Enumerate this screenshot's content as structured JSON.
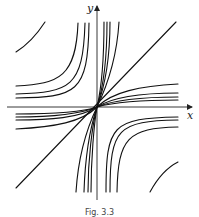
{
  "figure": {
    "x_axis_label": "x",
    "y_axis_label": "y",
    "caption": "Fig. 3.3"
  },
  "chart_data": {
    "type": "phase_portrait",
    "title": "",
    "xlabel": "x",
    "ylabel": "y",
    "colors": {
      "stroke": "#111111",
      "background": "#ffffff"
    },
    "curves": [
      {
        "group": "Q2-corner",
        "d": "M16,52 Q32,42 45,22"
      },
      {
        "group": "Q2-hyperbola",
        "d": "M16,86 C60,84 76,76 78,23"
      },
      {
        "group": "Q2-hyperbola",
        "d": "M16,94 C70,92 83,88 85,23"
      },
      {
        "group": "Q2-hyperbola",
        "d": "M16,98 C76,97 88,94 89,23"
      },
      {
        "group": "Q1-vertical",
        "d": "M97,107 C101,90 104,60 104,22"
      },
      {
        "group": "Q1-vertical",
        "d": "M97,107 C103,88 107,60 107,22"
      },
      {
        "group": "Q1-vertical",
        "d": "M97,107 C105,86 110,60 110,22"
      },
      {
        "group": "Q1-vertical",
        "d": "M97,107 C108,84 117,55 119,22"
      },
      {
        "group": "diagonal",
        "d": "M16,188 L176,22"
      },
      {
        "group": "Q1-horizontal",
        "d": "M97,107 C112,92 140,86 178,84"
      },
      {
        "group": "Q1-horizontal",
        "d": "M97,107 C114,96 145,93 178,93"
      },
      {
        "group": "Q1-horizontal",
        "d": "M97,107 C116,99 148,97 178,97"
      },
      {
        "group": "Q1-horizontal",
        "d": "M97,107 C118,101 150,100 178,100"
      },
      {
        "group": "Q3-horizontal",
        "d": "M97,107 C80,113 50,114 16,114"
      },
      {
        "group": "Q3-horizontal",
        "d": "M97,107 C78,115 48,117 16,117"
      },
      {
        "group": "Q3-horizontal",
        "d": "M97,107 C80,118 50,120 16,120"
      },
      {
        "group": "Q3-horizontal",
        "d": "M97,107 C82,122 55,127 16,129"
      },
      {
        "group": "Q3-vertical",
        "d": "M97,107 C86,130 78,160 76,192"
      },
      {
        "group": "Q3-vertical",
        "d": "M97,107 C90,128 85,160 84,192"
      },
      {
        "group": "Q3-vertical",
        "d": "M97,107 C92,126 88,160 88,192"
      },
      {
        "group": "Q3-vertical",
        "d": "M97,107 C94,124 91,160 91,192"
      },
      {
        "group": "Q4-hyperbola",
        "d": "M106,192 C106,125 112,118 178,117"
      },
      {
        "group": "Q4-hyperbola",
        "d": "M110,192 C110,128 118,121 178,120"
      },
      {
        "group": "Q4-hyperbola",
        "d": "M117,192 C118,138 128,128 178,127"
      },
      {
        "group": "Q4-corner",
        "d": "M150,192 Q162,170 178,162"
      }
    ],
    "axes": {
      "origin_px": [
        97,
        107
      ],
      "x_axis": {
        "from": [
          7,
          107
        ],
        "to": [
          193,
          107
        ]
      },
      "y_axis": {
        "from": [
          97,
          200
        ],
        "to": [
          97,
          5
        ]
      }
    }
  }
}
